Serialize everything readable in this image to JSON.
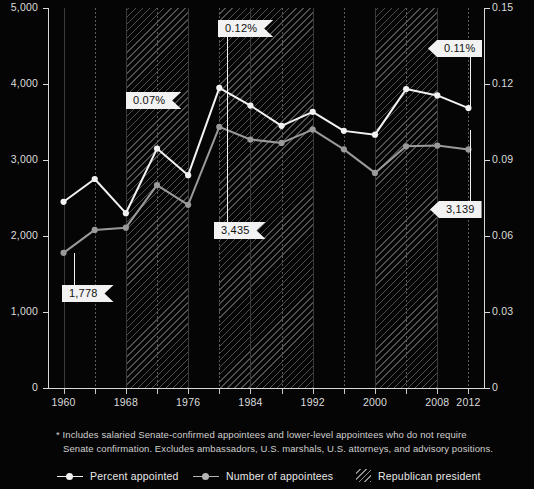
{
  "chart_data": {
    "type": "line",
    "title": "",
    "x": [
      1960,
      1964,
      1968,
      1972,
      1976,
      1980,
      1984,
      1988,
      1992,
      1996,
      2000,
      2004,
      2008,
      2012
    ],
    "xlabel": "",
    "xtick_labels": [
      "1960",
      "1968",
      "1976",
      "1984",
      "1992",
      "2000",
      "2008",
      "2012"
    ],
    "xtick_values": [
      1960,
      1968,
      1976,
      1984,
      1992,
      2000,
      2008,
      2012
    ],
    "xlim": [
      1958,
      2014
    ],
    "grid": true,
    "legend_position": "bottom",
    "axes": {
      "left": {
        "label": "Number of appointees",
        "ylim": [
          0,
          5000
        ],
        "ticks": [
          0,
          1000,
          2000,
          3000,
          4000,
          5000
        ],
        "tick_labels": [
          "0",
          "1,000",
          "2,000",
          "3,000",
          "4,000",
          "5,000"
        ]
      },
      "right": {
        "label": "Percent appointed",
        "ylim": [
          0,
          0.15
        ],
        "ticks": [
          0,
          0.03,
          0.06,
          0.09,
          0.12,
          0.15
        ],
        "tick_labels": [
          "0",
          "0.03",
          "0.06",
          "0.09",
          "0.12",
          "0.15"
        ]
      }
    },
    "series": [
      {
        "name": "Percent appointed",
        "axis": "right",
        "color": "#f2f2f2",
        "values": [
          0.0735,
          0.0825,
          0.069,
          0.0945,
          0.084,
          0.1185,
          0.1115,
          0.1035,
          0.109,
          0.1015,
          0.1,
          0.118,
          0.1155,
          0.1105
        ]
      },
      {
        "name": "Number of appointees",
        "axis": "left",
        "color": "#9a9a9a",
        "values": [
          1778,
          2080,
          2110,
          2670,
          2410,
          3435,
          3270,
          3225,
          3400,
          3140,
          2830,
          3180,
          3190,
          3139
        ]
      }
    ],
    "shaded_regions": [
      {
        "label": "Republican president",
        "start": 1968,
        "end": 1976
      },
      {
        "label": "Republican president",
        "start": 1980,
        "end": 1992
      },
      {
        "label": "Republican president",
        "start": 2000,
        "end": 2008
      }
    ],
    "annotations": [
      {
        "text": "1,778",
        "year": 1960,
        "series": "Number of appointees",
        "direction": "left"
      },
      {
        "text": "0.07%",
        "year": 1976,
        "series": "Percent appointed",
        "direction": "left"
      },
      {
        "text": "0.12%",
        "year": 1980,
        "series": "Percent appointed",
        "direction": "left"
      },
      {
        "text": "3,435",
        "year": 1980,
        "series": "Number of appointees",
        "direction": "left"
      },
      {
        "text": "0.11%",
        "year": 2012,
        "series": "Percent appointed",
        "direction": "left"
      },
      {
        "text": "3,139",
        "year": 2012,
        "series": "Number of appointees",
        "direction": "left"
      }
    ]
  },
  "footnote": {
    "line1": "* Includes salaried Senate-confirmed appointees and lower-level appointees who do not require",
    "line2": "Senate confirmation. Excludes ambassadors, U.S. marshals, U.S. attorneys, and advisory positions."
  },
  "legend": {
    "items": [
      {
        "label": "Percent appointed",
        "type": "line",
        "color": "#f2f2f2"
      },
      {
        "label": "Number of appointees",
        "type": "line",
        "color": "#9a9a9a"
      },
      {
        "label": "Republican president",
        "type": "hatch",
        "color": "#ffffff"
      }
    ]
  },
  "colors": {
    "background": "#050505",
    "axis": "#d8d8d8",
    "text": "#e8e8e8",
    "percent_line": "#f2f2f2",
    "number_line": "#9a9a9a",
    "callout_bg": "#f2f2f2",
    "callout_text": "#111111"
  }
}
